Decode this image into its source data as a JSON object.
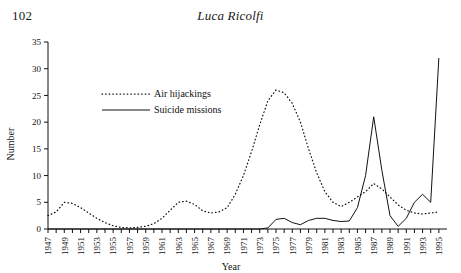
{
  "page": {
    "number": "102",
    "running_head": "Luca Ricolfi"
  },
  "chart_data": {
    "type": "line",
    "title": "",
    "xlabel": "Year",
    "ylabel": "Number",
    "xlim": [
      1947,
      1996
    ],
    "ylim": [
      0,
      35
    ],
    "yticks": [
      0,
      5,
      10,
      15,
      20,
      25,
      30,
      35
    ],
    "grid": false,
    "legend_position": "upper-left-inside",
    "x": [
      1947,
      1948,
      1949,
      1950,
      1951,
      1952,
      1953,
      1954,
      1955,
      1956,
      1957,
      1958,
      1959,
      1960,
      1961,
      1962,
      1963,
      1964,
      1965,
      1966,
      1967,
      1968,
      1969,
      1970,
      1971,
      1972,
      1973,
      1974,
      1975,
      1976,
      1977,
      1978,
      1979,
      1980,
      1981,
      1982,
      1983,
      1984,
      1985,
      1986,
      1987,
      1988,
      1989,
      1990,
      1991,
      1992,
      1993,
      1994,
      1995
    ],
    "xtick_labels": [
      "1947",
      "1949",
      "1951",
      "1953",
      "1955",
      "1957",
      "1959",
      "1961",
      "1963",
      "1965",
      "1967",
      "1969",
      "1971",
      "1973",
      "1975",
      "1977",
      "1979",
      "1981",
      "1983",
      "1985",
      "1987",
      "1989",
      "1991",
      "1993",
      "1995"
    ],
    "series": [
      {
        "name": "Air hijackings",
        "style": "dotted",
        "values": [
          2.5,
          3.2,
          5.0,
          4.8,
          4.0,
          3.0,
          2.0,
          1.2,
          0.6,
          0.3,
          0.2,
          0.3,
          0.5,
          1.0,
          2.0,
          3.5,
          5.0,
          5.2,
          4.6,
          3.4,
          3.0,
          3.2,
          4.0,
          6.5,
          10.0,
          14.5,
          19.5,
          24.0,
          26.0,
          25.5,
          23.5,
          20.0,
          15.0,
          10.5,
          7.0,
          5.0,
          4.2,
          5.0,
          6.0,
          7.0,
          8.5,
          7.5,
          6.0,
          4.5,
          3.5,
          3.0,
          2.8,
          3.0,
          3.2
        ]
      },
      {
        "name": "Suicide missions",
        "style": "solid",
        "values": [
          0,
          0,
          0,
          0,
          0,
          0,
          0,
          0,
          0,
          0,
          0,
          0,
          0,
          0,
          0,
          0,
          0,
          0,
          0,
          0,
          0,
          0,
          0,
          0,
          0,
          0,
          0,
          0.2,
          1.8,
          2.0,
          1.2,
          0.8,
          1.6,
          2.0,
          2.0,
          1.6,
          1.4,
          1.5,
          4.0,
          10.0,
          21.0,
          11.0,
          2.5,
          0.5,
          2.0,
          5.0,
          6.5,
          5.0,
          32.0
        ]
      }
    ],
    "legend": [
      {
        "label": "Air hijackings",
        "style": "dotted"
      },
      {
        "label": "Suicide missions",
        "style": "solid"
      }
    ]
  }
}
